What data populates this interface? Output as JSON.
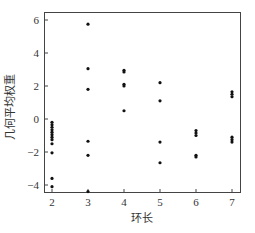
{
  "chart_data": {
    "type": "scatter",
    "title": "",
    "xlabel": "环长",
    "ylabel": "几何平均权重",
    "xlim": [
      1.8,
      7.2
    ],
    "ylim": [
      -4.4,
      6.5
    ],
    "xticks": [
      2,
      3,
      4,
      5,
      6,
      7
    ],
    "yticks": [
      -4,
      -2,
      0,
      2,
      4,
      6
    ],
    "grid": false,
    "legend": null,
    "series": [
      {
        "name": "points",
        "color": "#111111",
        "points": [
          {
            "x": 2,
            "y": -0.2
          },
          {
            "x": 2,
            "y": -0.35
          },
          {
            "x": 2,
            "y": -0.5
          },
          {
            "x": 2,
            "y": -0.65
          },
          {
            "x": 2,
            "y": -0.8
          },
          {
            "x": 2,
            "y": -0.95
          },
          {
            "x": 2,
            "y": -1.1
          },
          {
            "x": 2,
            "y": -1.25
          },
          {
            "x": 2,
            "y": -1.5
          },
          {
            "x": 2,
            "y": -2.05
          },
          {
            "x": 2,
            "y": -3.6
          },
          {
            "x": 2,
            "y": -4.1
          },
          {
            "x": 3,
            "y": 5.75
          },
          {
            "x": 3,
            "y": 3.05
          },
          {
            "x": 3,
            "y": 1.8
          },
          {
            "x": 3,
            "y": -1.35
          },
          {
            "x": 3,
            "y": -2.2
          },
          {
            "x": 3,
            "y": -4.4
          },
          {
            "x": 4,
            "y": 2.95
          },
          {
            "x": 4,
            "y": 2.85
          },
          {
            "x": 4,
            "y": 2.1
          },
          {
            "x": 4,
            "y": 2.0
          },
          {
            "x": 4,
            "y": 0.5
          },
          {
            "x": 5,
            "y": 2.2
          },
          {
            "x": 5,
            "y": 1.1
          },
          {
            "x": 5,
            "y": -1.4
          },
          {
            "x": 5,
            "y": -2.65
          },
          {
            "x": 6,
            "y": -0.7
          },
          {
            "x": 6,
            "y": -0.85
          },
          {
            "x": 6,
            "y": -1.0
          },
          {
            "x": 6,
            "y": -2.2
          },
          {
            "x": 6,
            "y": -2.3
          },
          {
            "x": 7,
            "y": 1.65
          },
          {
            "x": 7,
            "y": 1.5
          },
          {
            "x": 7,
            "y": 1.35
          },
          {
            "x": 7,
            "y": -1.1
          },
          {
            "x": 7,
            "y": -1.25
          },
          {
            "x": 7,
            "y": -1.4
          }
        ]
      }
    ]
  },
  "layout": {
    "plot": {
      "left": 44,
      "top": 12,
      "right": 240,
      "bottom": 192
    },
    "x_px": {
      "origin_value": 2,
      "origin_px": 52,
      "px_per_unit": 36
    },
    "y_px": {
      "origin_value": 0,
      "origin_px": 119,
      "px_per_unit": 16.5
    },
    "axis_color": "#444444",
    "point_radius": 1.6
  }
}
